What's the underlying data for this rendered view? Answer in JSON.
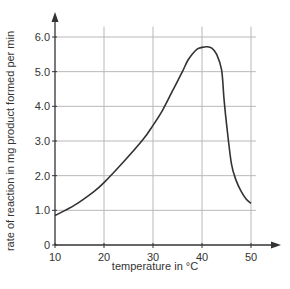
{
  "chart_data": {
    "type": "line",
    "title": "",
    "xlabel": "temperature in °C",
    "ylabel": "rate of reaction in mg product formed per min",
    "xlim": [
      10,
      50
    ],
    "ylim": [
      0,
      6.0
    ],
    "grid": true,
    "legend": null,
    "x_ticks": [
      10,
      20,
      30,
      40,
      50
    ],
    "x_tick_labels": [
      "10",
      "20",
      "30",
      "40",
      "50"
    ],
    "y_ticks": [
      0,
      1.0,
      2.0,
      3.0,
      4.0,
      5.0,
      6.0
    ],
    "y_tick_labels": [
      "0",
      "1.0",
      "2.0",
      "3.0",
      "4.0",
      "5.0",
      "6.0"
    ],
    "series": [
      {
        "name": "rate of reaction",
        "x": [
          10,
          14,
          18,
          20,
          24,
          28,
          30,
          32,
          34,
          36,
          37,
          38,
          39,
          40,
          41,
          42,
          43,
          44,
          44.5,
          45,
          46,
          47,
          48,
          49,
          50
        ],
        "values": [
          0.85,
          1.15,
          1.55,
          1.8,
          2.4,
          3.05,
          3.45,
          3.9,
          4.45,
          5.0,
          5.3,
          5.5,
          5.65,
          5.7,
          5.72,
          5.68,
          5.5,
          5.05,
          4.2,
          3.5,
          2.35,
          1.85,
          1.55,
          1.33,
          1.2
        ]
      }
    ]
  }
}
